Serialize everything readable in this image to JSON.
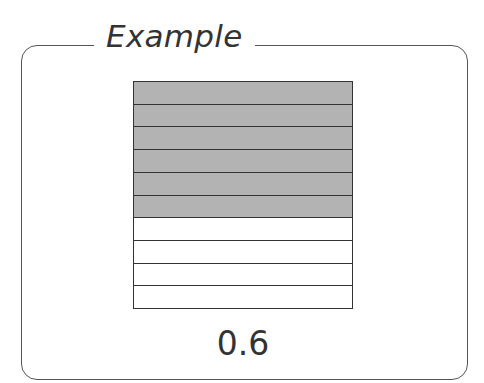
{
  "title": "Example",
  "diagram": {
    "type": "fraction-grid",
    "total_rows": 10,
    "shaded_rows": 6,
    "shaded_color": "#b3b3b3",
    "value_label": "0.6"
  }
}
